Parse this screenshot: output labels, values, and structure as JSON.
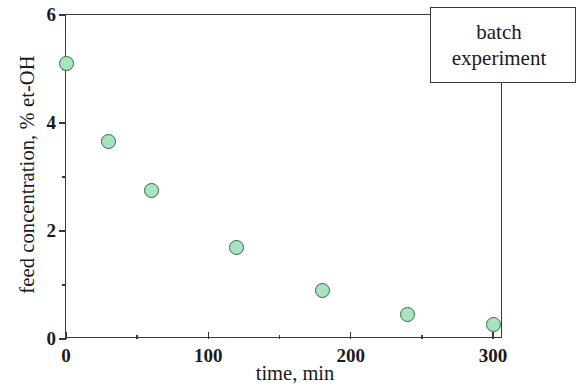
{
  "chart_data": {
    "type": "scatter",
    "title": "",
    "xlabel": "time, min",
    "ylabel": "feed concentration, % et-OH",
    "xlim": [
      0,
      307
    ],
    "ylim": [
      0,
      6
    ],
    "grid": false,
    "legend_position": "top-right",
    "annotation_lines": [
      "batch",
      "experiment"
    ],
    "marker_fill_color": "#a9e3bf",
    "marker_edge_color": "#2f6b47",
    "axis_color": "#3a3a3a",
    "x_ticks_major": [
      0,
      100,
      200,
      300
    ],
    "x_tick_labels": [
      "0",
      "100",
      "200",
      "300"
    ],
    "x_ticks_minor": [
      50,
      150,
      250
    ],
    "y_ticks_major": [
      0,
      2,
      4,
      6
    ],
    "y_tick_labels": [
      "0",
      "2",
      "4",
      "6"
    ],
    "y_ticks_minor": [
      1,
      3,
      5
    ],
    "series": [
      {
        "name": "batch experiment",
        "x": [
          0,
          30,
          60,
          120,
          180,
          240,
          300
        ],
        "y": [
          5.1,
          3.65,
          2.75,
          1.7,
          0.9,
          0.45,
          0.27
        ]
      }
    ]
  }
}
